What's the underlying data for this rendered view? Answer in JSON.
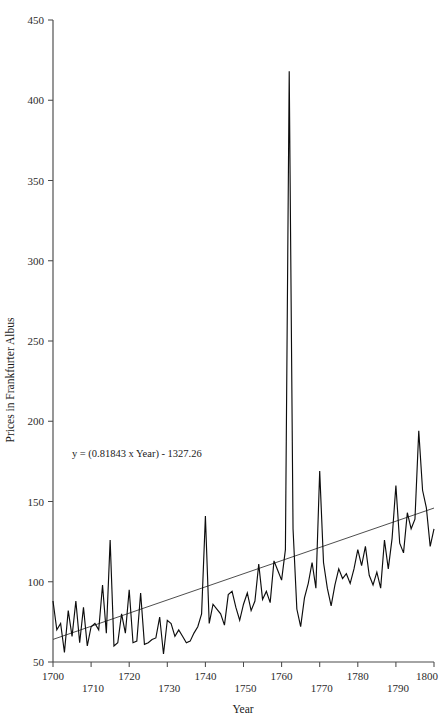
{
  "chart_data": {
    "type": "line",
    "title": "",
    "subtitle": "",
    "xlabel": "Year",
    "ylabel": "Prices in Frankfurter Albus",
    "xlim": [
      1700,
      1800
    ],
    "ylim": [
      50,
      450
    ],
    "grid": false,
    "legend": null,
    "xticks": [
      1700,
      1710,
      1720,
      1730,
      1740,
      1750,
      1760,
      1770,
      1780,
      1790,
      1800
    ],
    "xtick_labels": [
      "1700",
      "1710",
      "1720",
      "1730",
      "1740",
      "1750",
      "1760",
      "1770",
      "1780",
      "1790",
      "1800"
    ],
    "yticks": [
      50,
      100,
      150,
      200,
      250,
      300,
      350,
      400,
      450
    ],
    "ytick_labels": [
      "50",
      "100",
      "150",
      "200",
      "250",
      "300",
      "350",
      "400",
      "450"
    ],
    "annotations": [
      {
        "name": "regression-equation",
        "text": "y = (0.81843 x Year) - 1327.26",
        "x": 1722,
        "y": 178
      }
    ],
    "series": [
      {
        "name": "Prices in Frankfurter Albus",
        "color": "#0d0d0d",
        "x": [
          1700,
          1701,
          1702,
          1703,
          1704,
          1705,
          1706,
          1707,
          1708,
          1709,
          1710,
          1711,
          1712,
          1713,
          1714,
          1715,
          1716,
          1717,
          1718,
          1719,
          1720,
          1721,
          1722,
          1723,
          1724,
          1725,
          1726,
          1727,
          1728,
          1729,
          1730,
          1731,
          1732,
          1733,
          1734,
          1735,
          1736,
          1737,
          1738,
          1739,
          1740,
          1741,
          1742,
          1743,
          1744,
          1745,
          1746,
          1747,
          1748,
          1749,
          1750,
          1751,
          1752,
          1753,
          1754,
          1755,
          1756,
          1757,
          1758,
          1759,
          1760,
          1761,
          1762,
          1763,
          1764,
          1765,
          1766,
          1767,
          1768,
          1769,
          1770,
          1771,
          1772,
          1773,
          1774,
          1775,
          1776,
          1777,
          1778,
          1779,
          1780,
          1781,
          1782,
          1783,
          1784,
          1785,
          1786,
          1787,
          1788,
          1789,
          1790,
          1791,
          1792,
          1793,
          1794,
          1795,
          1796,
          1797,
          1798,
          1799,
          1800
        ],
        "y": [
          88,
          70,
          74,
          56,
          82,
          66,
          88,
          62,
          84,
          60,
          72,
          74,
          70,
          98,
          68,
          126,
          60,
          62,
          80,
          68,
          95,
          62,
          63,
          93,
          61,
          62,
          64,
          65,
          78,
          55,
          76,
          74,
          66,
          70,
          66,
          62,
          63,
          68,
          72,
          80,
          141,
          74,
          86,
          83,
          80,
          73,
          92,
          94,
          84,
          76,
          86,
          93,
          82,
          88,
          111,
          89,
          94,
          87,
          113,
          107,
          101,
          120,
          418,
          133,
          83,
          72,
          90,
          99,
          112,
          96,
          169,
          112,
          96,
          85,
          98,
          108,
          102,
          105,
          99,
          108,
          120,
          110,
          122,
          104,
          98,
          106,
          96,
          126,
          108,
          127,
          160,
          124,
          118,
          143,
          133,
          139,
          194,
          157,
          146,
          122,
          133
        ]
      }
    ],
    "trendline": {
      "name": "linear-regression",
      "color": "#2e2e2e",
      "equation": "y = (0.81843 x Year) - 1327.26",
      "slope": 0.81843,
      "intercept": -1327.26,
      "x_start": 1700,
      "x_end": 1800,
      "y_start": 64.07,
      "y_end": 145.91
    }
  }
}
